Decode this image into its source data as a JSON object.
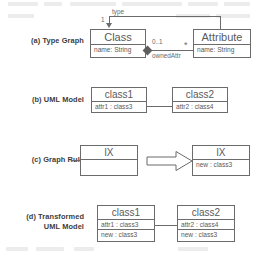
{
  "figure": {
    "rows": [
      {
        "id": "a",
        "label_lines": [
          "(a) Type Graph"
        ]
      },
      {
        "id": "b",
        "label_lines": [
          "(b) UML Model"
        ]
      },
      {
        "id": "c",
        "label_lines": [
          "(c) Graph Rule"
        ]
      },
      {
        "id": "d",
        "label_lines": [
          "(d) Transformed",
          "UML Model"
        ]
      }
    ],
    "type_graph": {
      "class_box": {
        "title": "Class",
        "attributes": [
          "name: String"
        ]
      },
      "attribute_box": {
        "title": "Attribute",
        "attributes": [
          "name: String"
        ]
      },
      "edges": {
        "type_label": "type",
        "type_multiplicity": "1",
        "owned_attr_label": "ownedAttr",
        "source_multiplicity": "0..1",
        "target_multiplicity": "*"
      }
    },
    "uml_model": {
      "left_box": {
        "title": "class1",
        "attributes": [
          "attr1 : class3"
        ]
      },
      "right_box": {
        "title": "class2",
        "attributes": [
          "attr2 : class4"
        ]
      }
    },
    "graph_rule": {
      "lhs_box": {
        "title": "lX",
        "attributes": []
      },
      "rhs_box": {
        "title": "lX",
        "attributes": [
          "new : class3"
        ]
      },
      "arrow": "transform-arrow"
    },
    "transformed_model": {
      "left_box": {
        "title": "class1",
        "attributes": [
          "attr1 : class3",
          "new : class3"
        ]
      },
      "right_box": {
        "title": "class2",
        "attributes": [
          "attr2 : class4",
          "new : class3"
        ]
      }
    }
  },
  "colors": {
    "stroke": "#6b6b6b",
    "text": "#5a5a5a",
    "label": "#3c3c3c",
    "background": "#ffffff"
  }
}
